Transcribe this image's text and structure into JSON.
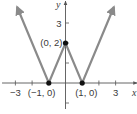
{
  "chart_data": {
    "type": "line",
    "title": "",
    "xlabel": "x",
    "ylabel": "y",
    "xlim": [
      -3.8,
      4.3
    ],
    "ylim": [
      -1.3,
      4.1
    ],
    "grid": false,
    "legend": null,
    "x_ticks": [
      -3,
      -2,
      -1,
      1,
      2,
      3
    ],
    "x_tick_labels": [
      {
        "x": -3,
        "label": "−3"
      },
      {
        "x": 3,
        "label": "3"
      }
    ],
    "y_ticks": [
      -1,
      1,
      2,
      3
    ],
    "y_tick_labels": [
      {
        "y": 3,
        "label": "3"
      }
    ],
    "series": [
      {
        "name": "graph",
        "x": [
          -2.9,
          -1,
          0,
          1,
          2.9
        ],
        "y": [
          3.8,
          0,
          2,
          0,
          3.8
        ],
        "arrows_at_ends": true,
        "color": "#8a8a8a"
      }
    ],
    "points": [
      {
        "x": -1,
        "y": 0,
        "label": "(−1, 0)"
      },
      {
        "x": 0,
        "y": 2,
        "label": "(0, 2)"
      },
      {
        "x": 1,
        "y": 0,
        "label": "(1, 0)"
      }
    ]
  }
}
